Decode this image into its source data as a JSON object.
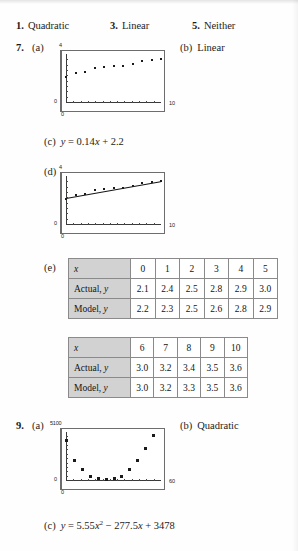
{
  "page": {
    "answers_row": [
      {
        "number": "1.",
        "text": "Quadratic",
        "left": 16
      },
      {
        "number": "3.",
        "text": "Linear",
        "left": 110
      },
      {
        "number": "5.",
        "text": "Neither",
        "left": 192
      }
    ]
  },
  "problem7": {
    "number": "7.",
    "part_a_label": "(a)",
    "part_b_label": "(b)",
    "part_b_answer": "Linear",
    "part_c_label": "(c)",
    "part_c_equation_prefix": "y",
    "part_c_equation": "y = 0.14x + 2.2",
    "part_d_label": "(d)",
    "part_e_label": "(e)",
    "graph_a": {
      "y_max_label": "4",
      "x_max_label": "10",
      "y_zero_label": "0",
      "x_zero_label": "0"
    },
    "graph_d": {
      "y_max_label": "4",
      "x_max_label": "10",
      "y_zero_label": "0",
      "x_zero_label": "0"
    },
    "table1": {
      "row_headers": [
        "x",
        "Actual, y",
        "Model, y"
      ],
      "x_values": [
        "0",
        "1",
        "2",
        "3",
        "4",
        "5"
      ],
      "actual_values": [
        "2.1",
        "2.4",
        "2.5",
        "2.8",
        "2.9",
        "3.0"
      ],
      "model_values": [
        "2.2",
        "2.3",
        "2.5",
        "2.6",
        "2.8",
        "2.9"
      ]
    },
    "table2": {
      "row_headers": [
        "x",
        "Actual, y",
        "Model, y"
      ],
      "x_values": [
        "6",
        "7",
        "8",
        "9",
        "10"
      ],
      "actual_values": [
        "3.0",
        "3.2",
        "3.4",
        "3.5",
        "3.6"
      ],
      "model_values": [
        "3.0",
        "3.2",
        "3.3",
        "3.5",
        "3.6"
      ]
    }
  },
  "problem9": {
    "number": "9.",
    "part_a_label": "(a)",
    "part_b_label": "(b)",
    "part_b_answer": "Quadratic",
    "part_c_label": "(c)",
    "part_c_equation": "y = 5.55x2 - 277.5x + 3478",
    "graph_a": {
      "y_max_label": "5100",
      "x_max_label": "60",
      "y_zero_label": "0",
      "x_zero_label": "0"
    }
  },
  "chart_data": [
    {
      "type": "scatter",
      "id": "problem7-graph-a",
      "title": "",
      "xlabel": "",
      "ylabel": "",
      "xlim": [
        0,
        10
      ],
      "ylim": [
        0,
        4
      ],
      "grid": false,
      "x": [
        0,
        1,
        2,
        3,
        4,
        5,
        6,
        7,
        8,
        9,
        10
      ],
      "y": [
        2.1,
        2.4,
        2.5,
        2.8,
        2.9,
        3.0,
        3.0,
        3.2,
        3.4,
        3.5,
        3.6
      ],
      "tick_labels_x": [
        "0",
        "10"
      ],
      "tick_labels_y": [
        "0",
        "4"
      ]
    },
    {
      "type": "scatter",
      "id": "problem7-graph-d",
      "title": "",
      "xlabel": "",
      "ylabel": "",
      "xlim": [
        0,
        10
      ],
      "ylim": [
        0,
        4
      ],
      "grid": false,
      "x": [
        0,
        1,
        2,
        3,
        4,
        5,
        6,
        7,
        8,
        9,
        10
      ],
      "y": [
        2.1,
        2.4,
        2.5,
        2.8,
        2.9,
        3.0,
        3.0,
        3.2,
        3.4,
        3.5,
        3.6
      ],
      "fit_line": {
        "slope": 0.14,
        "intercept": 2.2,
        "label": "y = 0.14x + 2.2"
      },
      "tick_labels_x": [
        "0",
        "10"
      ],
      "tick_labels_y": [
        "0",
        "4"
      ]
    },
    {
      "type": "scatter",
      "id": "problem9-graph-a",
      "title": "",
      "xlabel": "",
      "ylabel": "",
      "xlim": [
        0,
        60
      ],
      "ylim": [
        0,
        5100
      ],
      "grid": false,
      "x": [
        0,
        5,
        10,
        15,
        20,
        25,
        30,
        35,
        40,
        45,
        50,
        55
      ],
      "y": [
        4300,
        2100,
        1150,
        420,
        160,
        90,
        160,
        420,
        1150,
        2100,
        3400,
        4800
      ],
      "tick_labels_x": [
        "0",
        "60"
      ],
      "tick_labels_y": [
        "0",
        "5100"
      ]
    }
  ]
}
